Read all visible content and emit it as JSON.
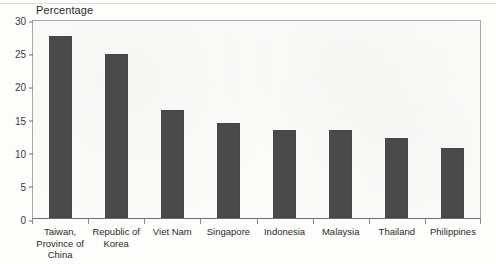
{
  "chart_data": {
    "type": "bar",
    "title": "",
    "subtitle": "",
    "xlabel": "",
    "ylabel": "Percentage",
    "ylim": [
      0,
      30
    ],
    "yticks": [
      0,
      5,
      10,
      15,
      20,
      25,
      30
    ],
    "grid": false,
    "legend": null,
    "legend_position": "none",
    "bar_color": "#4a4a4a",
    "categories": [
      "Taiwan, Province of China",
      "Republic of Korea",
      "Viet Nam",
      "Singapore",
      "Indonesia",
      "Malaysia",
      "Thailand",
      "Philippines"
    ],
    "category_lines": [
      [
        "Taiwan,",
        "Province of",
        "China"
      ],
      [
        "Republic of",
        "Korea"
      ],
      [
        "Viet Nam"
      ],
      [
        "Singapore"
      ],
      [
        "Indonesia"
      ],
      [
        "Malaysia"
      ],
      [
        "Thailand"
      ],
      [
        "Philippines"
      ]
    ],
    "values": [
      27.5,
      24.7,
      16.3,
      14.3,
      13.3,
      13.2,
      12.1,
      10.6
    ],
    "series": [
      {
        "name": "Percentage",
        "values": [
          27.5,
          24.7,
          16.3,
          14.3,
          13.3,
          13.2,
          12.1,
          10.6
        ]
      }
    ]
  },
  "axis": {
    "y_title": "Percentage",
    "y_tick_labels": [
      "30",
      "25",
      "20",
      "15",
      "10",
      "5",
      "0"
    ]
  }
}
